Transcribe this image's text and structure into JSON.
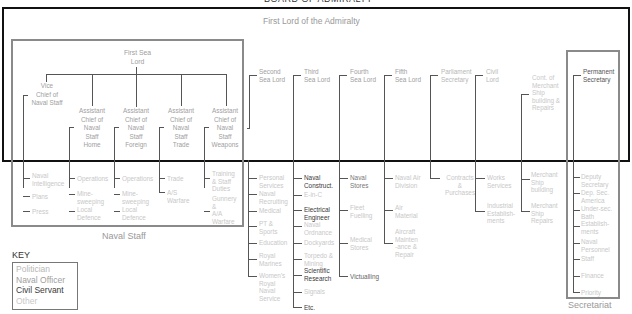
{
  "title": "BOARD OF ADMIRALTY",
  "top": "First Lord of the Admiralty",
  "naval_staff": {
    "label": "Naval Staff",
    "head": "First Sea\nLord",
    "vcns": "Vice\nChief of\nNaval Staff",
    "acns": [
      "Assistant\nChief of\nNaval\nStaff\nHome",
      "Assistant\nChief of\nNaval\nStaff\nForeign",
      "Assistant\nChief of\nNaval\nStaff\nTrade",
      "Assistant\nChief of\nNaval\nStaff\nWeapons"
    ],
    "divisions": {
      "vcns": [
        "Naval\nIntelligence",
        "Plans",
        "Press"
      ],
      "home": [
        "Operations",
        "Mine-\nsweeping",
        "Local\nDefence"
      ],
      "foreign": [
        "Operations",
        "Mine-\nsweeping",
        "Local\nDefence"
      ],
      "trade": [
        "Trade",
        "A/S\nWarfare"
      ],
      "weapons": [
        "Training\n& Staff\nDuties",
        "Gunnery\n&\nA/A\nWarfare"
      ]
    }
  },
  "lords": {
    "second": {
      "name": "Second\nSea Lord",
      "items": [
        "Personal\nServices",
        "Naval\nRecruiting",
        "Medical",
        "PT &\nSports",
        "Education",
        "Royal\nMarines",
        "Women's\nRoyal\nNaval\nService"
      ]
    },
    "third": {
      "name": "Third\nSea Lord",
      "items": [
        "Naval\nConstruct.",
        "E-in-C",
        "Electrical\nEngineer",
        "Naval\nOrdnance",
        "Dockyards",
        "Torpedo &\nMining",
        "Scientific\nResearch",
        "Signals",
        "Etc."
      ]
    },
    "fourth": {
      "name": "Fourth\nSea Lord",
      "items": [
        "Naval\nStores",
        "Fleet\nFuelling",
        "Medical\nStores",
        "Victualling"
      ]
    },
    "fifth": {
      "name": "Fifth\nSea Lord",
      "items": [
        "Naval Air\nDivision",
        "Air\nMaterial",
        "Aircraft\nMainten\n-ance &\nRepair"
      ]
    },
    "parl": {
      "name": "Parliament\nSecretary",
      "items": [
        "Contracts\n&\nPurchases"
      ]
    },
    "civil": {
      "name": "Civil\nLord",
      "items": [
        "Works\nServices",
        "Industrial\nEstablish-\nments"
      ]
    },
    "cont": {
      "name": "Cont. of\nMerchant\nShip\nbuilding &\nRepairs",
      "items": [
        "Merchant\nShip\nbuilding",
        "Merchant\nShip\nRepairs"
      ]
    }
  },
  "secretariat": {
    "label": "Secretariat",
    "head": "Permanent\nSecretary",
    "items": [
      "Deputy\nSecretary",
      "Dep. Sec.\nAmerica",
      "Under-sec.\nBath",
      "Establish-\nments",
      "Naval\nPersonnel",
      "Staff",
      "Finance",
      "Priority"
    ]
  },
  "key": {
    "title": "KEY",
    "entries": [
      "Politician",
      "Naval Officer",
      "Civil Servant",
      "Other"
    ],
    "colors": {
      "politician": "#b8b8b8",
      "naval_officer": "#a0a0a0",
      "civil_servant": "#3a3a3a",
      "other": "#c8c8c8"
    }
  }
}
